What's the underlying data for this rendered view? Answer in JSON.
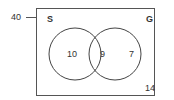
{
  "venn": {
    "universal_total": "40",
    "set_a": {
      "label": "S",
      "only": "10"
    },
    "set_b": {
      "label": "G",
      "only": "7"
    },
    "intersection": "9",
    "outside": "14"
  }
}
